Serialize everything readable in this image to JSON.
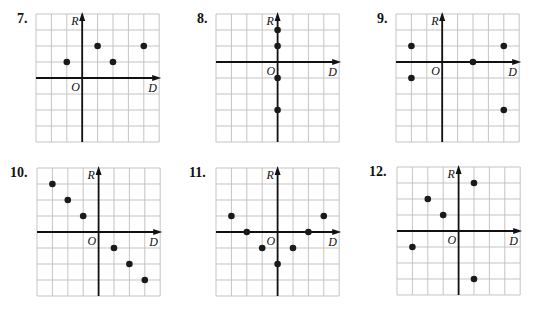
{
  "grid": {
    "cols": 8,
    "rows": 8,
    "cell_w": 15.4,
    "cell_h": 16,
    "grid_color": "#c4c4c4",
    "axis_color": "#111111",
    "dot_color": "#1a1a1a"
  },
  "axis_labels": {
    "x": "D",
    "y": "R",
    "origin": "O"
  },
  "chart_data": [
    {
      "type": "scatter",
      "title": "7.",
      "xlabel": "D",
      "ylabel": "R",
      "origin_label": "O",
      "x_range": [
        -3,
        5
      ],
      "y_range": [
        -4,
        4
      ],
      "grid": true,
      "points": [
        [
          -1,
          1
        ],
        [
          1,
          2
        ],
        [
          2,
          1
        ],
        [
          4,
          2
        ]
      ]
    },
    {
      "type": "scatter",
      "title": "8.",
      "xlabel": "D",
      "ylabel": "R",
      "origin_label": "O",
      "x_range": [
        -4,
        4
      ],
      "y_range": [
        -5,
        3
      ],
      "grid": true,
      "points": [
        [
          0,
          2
        ],
        [
          0,
          1
        ],
        [
          0,
          -1
        ],
        [
          0,
          -3
        ]
      ]
    },
    {
      "type": "scatter",
      "title": "9.",
      "xlabel": "D",
      "ylabel": "R",
      "origin_label": "O",
      "x_range": [
        -3,
        5
      ],
      "y_range": [
        -5,
        3
      ],
      "grid": true,
      "points": [
        [
          -2,
          1
        ],
        [
          -2,
          -1
        ],
        [
          2,
          0
        ],
        [
          4,
          1
        ],
        [
          4,
          -3
        ]
      ]
    },
    {
      "type": "scatter",
      "title": "10.",
      "xlabel": "D",
      "ylabel": "R",
      "origin_label": "O",
      "x_range": [
        -4,
        4
      ],
      "y_range": [
        -4,
        4
      ],
      "grid": true,
      "points": [
        [
          -3,
          3
        ],
        [
          -2,
          2
        ],
        [
          -1,
          1
        ],
        [
          1,
          -1
        ],
        [
          2,
          -2
        ],
        [
          3,
          -3
        ]
      ]
    },
    {
      "type": "scatter",
      "title": "11.",
      "xlabel": "D",
      "ylabel": "R",
      "origin_label": "O",
      "x_range": [
        -4,
        4
      ],
      "y_range": [
        -4,
        4
      ],
      "grid": true,
      "points": [
        [
          -3,
          1
        ],
        [
          -2,
          0
        ],
        [
          -1,
          -1
        ],
        [
          0,
          -2
        ],
        [
          1,
          -1
        ],
        [
          2,
          0
        ],
        [
          3,
          1
        ]
      ]
    },
    {
      "type": "scatter",
      "title": "12.",
      "xlabel": "D",
      "ylabel": "R",
      "origin_label": "O",
      "x_range": [
        -4,
        4
      ],
      "y_range": [
        -4,
        4
      ],
      "grid": true,
      "points": [
        [
          -3,
          -1
        ],
        [
          -2,
          2
        ],
        [
          -1,
          1
        ],
        [
          1,
          3
        ],
        [
          1,
          -3
        ]
      ]
    }
  ],
  "layout": [
    {
      "num_x": 17,
      "num_y": 11,
      "grid_x": 36,
      "grid_y": 14,
      "axis_col": 3,
      "axis_row": 4
    },
    {
      "num_x": 197,
      "num_y": 11,
      "grid_x": 216,
      "grid_y": 14,
      "axis_col": 4,
      "axis_row": 3
    },
    {
      "num_x": 377,
      "num_y": 11,
      "grid_x": 396,
      "grid_y": 14,
      "axis_col": 3,
      "axis_row": 3
    },
    {
      "num_x": 10,
      "num_y": 165,
      "grid_x": 37,
      "grid_y": 168,
      "axis_col": 4,
      "axis_row": 4
    },
    {
      "num_x": 189,
      "num_y": 165,
      "grid_x": 216,
      "grid_y": 168,
      "axis_col": 4,
      "axis_row": 4
    },
    {
      "num_x": 369,
      "num_y": 164,
      "grid_x": 397,
      "grid_y": 167,
      "axis_col": 4,
      "axis_row": 4
    }
  ]
}
